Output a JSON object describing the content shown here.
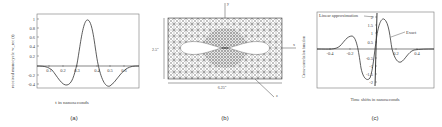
{
  "chart_data": [
    {
      "type": "line",
      "panel_label": "(a)",
      "title": "",
      "xlabel": "t in nanoseconds",
      "ylabel": "received monocycle  w_rec (t)",
      "xlim": [
        -0.05,
        0.7
      ],
      "ylim": [
        -0.45,
        1.1
      ],
      "xticks": [
        "0.1",
        "0.2",
        "0.3",
        "0.4",
        "0.5",
        "0.6"
      ],
      "yticks": [
        "1",
        "0.8",
        "0.6",
        "0.4",
        "0.2",
        "-0.2",
        "-0.4"
      ],
      "grid": false,
      "series": [
        {
          "name": "received monocycle",
          "x": [
            -0.05,
            0.0,
            0.05,
            0.1,
            0.15,
            0.2,
            0.25,
            0.3,
            0.35,
            0.4,
            0.45,
            0.5,
            0.55,
            0.6,
            0.65,
            0.7
          ],
          "y": [
            0.0,
            -0.01,
            -0.05,
            -0.18,
            -0.35,
            -0.42,
            -0.1,
            0.55,
            1.0,
            0.55,
            -0.1,
            -0.42,
            -0.35,
            -0.18,
            -0.05,
            0.0
          ]
        }
      ]
    },
    {
      "type": "diagram",
      "panel_label": "(b)",
      "title": "Triangular finite-element mesh of bow-tie antenna",
      "labels": {
        "y_axis": "y",
        "x_axis": "x",
        "z_axis": "z",
        "height": "2.5\"",
        "width": "6.25\""
      }
    },
    {
      "type": "line",
      "panel_label": "(c)",
      "title": "",
      "xlabel": "Time shifts in nanoseconds",
      "ylabel": "Cross-correlation function",
      "xlim": [
        -0.5,
        0.5
      ],
      "ylim": [
        -2.2,
        2.2
      ],
      "xticks": [
        "-0.4",
        "-0.2",
        "0.2",
        "0.4"
      ],
      "yticks": [
        "2",
        "1.5",
        "1",
        "0.5",
        "-0.5",
        "-1",
        "-1.5",
        "-2"
      ],
      "grid": false,
      "annotations": [
        "Linear approximation",
        "Exact"
      ],
      "series": [
        {
          "name": "Exact",
          "x": [
            -0.5,
            -0.4,
            -0.3,
            -0.22,
            -0.15,
            -0.1,
            -0.05,
            -0.02,
            0.0,
            0.03,
            0.06,
            0.1,
            0.15,
            0.2,
            0.25,
            0.3,
            0.35,
            0.4,
            0.5
          ],
          "y": [
            0.0,
            -0.02,
            0.2,
            0.75,
            0.3,
            -0.8,
            -1.75,
            -1.5,
            0.0,
            1.6,
            1.95,
            1.4,
            0.0,
            -0.8,
            -0.75,
            -0.2,
            0.05,
            0.0,
            0.0
          ]
        },
        {
          "name": "Linear approximation",
          "x": [
            -0.01,
            0.01
          ],
          "y": [
            -2.1,
            2.1
          ]
        }
      ]
    }
  ],
  "captions": {
    "a": "(a)",
    "b": "(b)",
    "c": "(c)"
  },
  "panel_a": {
    "ylabel": "received monocycle  w_rec (t)",
    "xlabel": "t in nanoseconds",
    "yticks": [
      {
        "v": "1",
        "y": 19
      },
      {
        "v": "0.8",
        "y": 28
      },
      {
        "v": "0.6",
        "y": 37
      },
      {
        "v": "0.4",
        "y": 46
      },
      {
        "v": "0.2",
        "y": 56
      },
      {
        "v": "-0.2",
        "y": 75
      },
      {
        "v": "-0.4",
        "y": 84
      }
    ],
    "xticks": [
      {
        "v": "0.1",
        "x": 49
      },
      {
        "v": "0.2",
        "x": 63
      },
      {
        "v": "0.3",
        "x": 77
      },
      {
        "v": "0.4",
        "x": 97
      },
      {
        "v": "0.5",
        "x": 110
      },
      {
        "v": "0.6",
        "x": 124
      }
    ]
  },
  "panel_b": {
    "height_label": "2.5\"",
    "width_label": "6.25\"",
    "y_label": "y",
    "x_label": "x",
    "z_label": "z"
  },
  "panel_c": {
    "ylabel": "Cross-correlation function",
    "xlabel": "Time shifts in nanoseconds",
    "linear_label": "Linear approximation",
    "exact_label": "Exact",
    "xticks": [
      {
        "v": "-0.4",
        "x": 330
      },
      {
        "v": "-0.2",
        "x": 350
      },
      {
        "v": "0.2",
        "x": 396
      },
      {
        "v": "0.4",
        "x": 417
      }
    ],
    "yticks": [
      {
        "v": "2",
        "y": 17
      },
      {
        "v": "1.5",
        "y": 25
      },
      {
        "v": "1",
        "y": 33
      },
      {
        "v": "0.5",
        "y": 42
      },
      {
        "v": "-0.5",
        "y": 58
      },
      {
        "v": "-1",
        "y": 66
      },
      {
        "v": "-1.5",
        "y": 74
      },
      {
        "v": "-2",
        "y": 82
      }
    ]
  }
}
